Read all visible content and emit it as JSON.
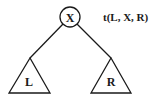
{
  "diagram": {
    "type": "binary-tree",
    "root": {
      "label": "X",
      "cx": 70,
      "cy": 17,
      "r": 10
    },
    "left_subtree": {
      "label": "L",
      "apex": [
        30,
        58
      ],
      "base_left": [
        9,
        93
      ],
      "base_right": [
        50,
        93
      ]
    },
    "right_subtree": {
      "label": "R",
      "apex": [
        111,
        58
      ],
      "base_left": [
        91,
        93
      ],
      "base_right": [
        131,
        93
      ]
    },
    "notation": "t(L, X, R)"
  }
}
